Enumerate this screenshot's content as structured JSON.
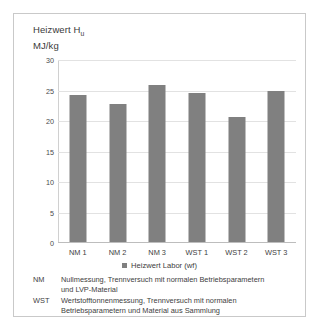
{
  "chart_data": {
    "type": "bar",
    "title": "Heizwert H",
    "title_subscript": "u",
    "unit_label": "MJ/kg",
    "categories": [
      "NM 1",
      "NM 2",
      "NM 3",
      "WST 1",
      "WST 2",
      "WST 3"
    ],
    "values": [
      24.1,
      22.6,
      25.8,
      24.4,
      20.5,
      24.7
    ],
    "series": [
      {
        "name": "Heizwert Labor (wf)",
        "values": [
          24.1,
          22.6,
          25.8,
          24.4,
          20.5,
          24.7
        ],
        "color": "#808080"
      }
    ],
    "xlabel": "",
    "ylabel": "MJ/kg",
    "ylim": [
      0,
      30
    ],
    "yticks": [
      0,
      5,
      10,
      15,
      20,
      25,
      30
    ],
    "ytick_labels": [
      "0",
      "5",
      "10",
      "15",
      "20",
      "25",
      "30"
    ],
    "grid": true,
    "legend_position": "bottom-center"
  },
  "legend": {
    "entries": [
      {
        "label": "Heizwert Labor (wf)",
        "color": "#808080",
        "marker": "square-marker"
      }
    ]
  },
  "footnotes": [
    {
      "key": "NM",
      "lines": [
        "Nullmessung, Trennversuch mit normalen Betriebsparametern",
        "und LVP-Material"
      ]
    },
    {
      "key": "WST",
      "lines": [
        "Wertstofftonnenmessung, Trennversuch mit normalen",
        "Betriebsparametern und Material aus Sammlung",
        "im Gebiet mit versuchsweise eingeführter Wertstofftonne"
      ]
    }
  ],
  "colors": {
    "bar": "#808080",
    "gridline": "#e2e2e2",
    "frame_border": "#c9c9c9",
    "text": "#3d3d3d",
    "background": "#ffffff"
  }
}
